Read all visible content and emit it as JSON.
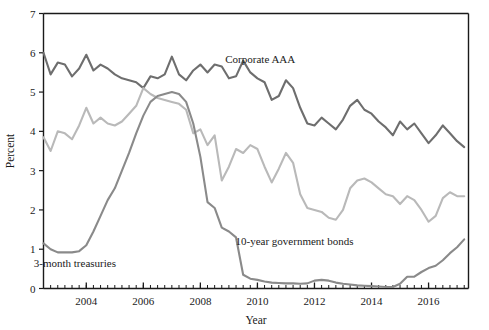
{
  "chart_data": {
    "type": "line",
    "title": "",
    "xlabel": "Year",
    "ylabel": "Percent",
    "xlim": [
      2002.5,
      2017.4
    ],
    "ylim": [
      0,
      7
    ],
    "yticks": [
      0,
      1,
      2,
      3,
      4,
      5,
      6,
      7
    ],
    "ytick_labels": [
      "0",
      "1",
      "2",
      "3",
      "4",
      "5",
      "6",
      "7"
    ],
    "xticks": [
      2004,
      2006,
      2008,
      2010,
      2012,
      2014,
      2016
    ],
    "xtick_labels": [
      "2004",
      "2006",
      "2008",
      "2010",
      "2012",
      "2014",
      "2016"
    ],
    "minor_xtick_interval": 0.25,
    "grid": false,
    "legend_position": "inline-annotations",
    "colors": {
      "corporate_aaa": "#6e6e6e",
      "ten_year_government_bonds": "#b9b9b9",
      "three_month_treasuries": "#8a8a8a",
      "axis": "#1a1a1a",
      "background": "#ffffff"
    },
    "annotations": [
      {
        "name": "corporate-aaa-label",
        "text": "Corporate AAA",
        "x": 2010.1,
        "y": 5.75
      },
      {
        "name": "ten-year-bonds-label",
        "text": "10-year government bonds",
        "x": 2011.3,
        "y": 1.1
      },
      {
        "name": "three-month-treasuries-label",
        "text": "3-month treasuries",
        "x": 2003.6,
        "y": 0.55
      }
    ],
    "x": [
      2002.5,
      2002.75,
      2003.0,
      2003.25,
      2003.5,
      2003.75,
      2004.0,
      2004.25,
      2004.5,
      2004.75,
      2005.0,
      2005.25,
      2005.5,
      2005.75,
      2006.0,
      2006.25,
      2006.5,
      2006.75,
      2007.0,
      2007.25,
      2007.5,
      2007.75,
      2008.0,
      2008.25,
      2008.5,
      2008.75,
      2009.0,
      2009.25,
      2009.5,
      2009.75,
      2010.0,
      2010.25,
      2010.5,
      2010.75,
      2011.0,
      2011.25,
      2011.5,
      2011.75,
      2012.0,
      2012.25,
      2012.5,
      2012.75,
      2013.0,
      2013.25,
      2013.5,
      2013.75,
      2014.0,
      2014.25,
      2014.5,
      2014.75,
      2015.0,
      2015.25,
      2015.5,
      2015.75,
      2016.0,
      2016.25,
      2016.5,
      2016.75,
      2017.0,
      2017.25
    ],
    "series": [
      {
        "name": "Corporate AAA",
        "key": "corporate_aaa",
        "color": "#6e6e6e",
        "values": [
          6.0,
          5.45,
          5.75,
          5.7,
          5.4,
          5.6,
          5.95,
          5.55,
          5.7,
          5.6,
          5.45,
          5.35,
          5.3,
          5.25,
          5.1,
          5.4,
          5.35,
          5.45,
          5.9,
          5.45,
          5.3,
          5.55,
          5.7,
          5.5,
          5.7,
          5.65,
          5.35,
          5.4,
          5.8,
          5.5,
          5.35,
          5.25,
          4.8,
          4.9,
          5.3,
          5.1,
          4.6,
          4.2,
          4.15,
          4.35,
          4.2,
          4.05,
          4.3,
          4.65,
          4.8,
          4.55,
          4.45,
          4.25,
          4.1,
          3.9,
          4.25,
          4.05,
          4.2,
          3.95,
          3.7,
          3.9,
          4.15,
          3.95,
          3.75,
          3.6
        ]
      },
      {
        "name": "10-year government bonds",
        "key": "ten_year_government_bonds",
        "color": "#b9b9b9",
        "values": [
          3.85,
          3.5,
          4.0,
          3.95,
          3.8,
          4.15,
          4.6,
          4.2,
          4.35,
          4.2,
          4.15,
          4.25,
          4.45,
          4.65,
          5.1,
          4.95,
          4.85,
          4.8,
          4.75,
          4.7,
          4.55,
          3.95,
          4.05,
          3.65,
          3.9,
          2.75,
          3.1,
          3.55,
          3.45,
          3.65,
          3.55,
          3.1,
          2.7,
          3.05,
          3.45,
          3.2,
          2.4,
          2.05,
          2.0,
          1.95,
          1.8,
          1.75,
          2.0,
          2.55,
          2.75,
          2.8,
          2.7,
          2.55,
          2.4,
          2.35,
          2.15,
          2.35,
          2.25,
          2.0,
          1.7,
          1.85,
          2.3,
          2.45,
          2.35,
          2.35
        ]
      },
      {
        "name": "3-month treasuries",
        "key": "three_month_treasuries",
        "color": "#8a8a8a",
        "values": [
          1.15,
          1.0,
          0.92,
          0.92,
          0.92,
          0.95,
          1.1,
          1.45,
          1.85,
          2.25,
          2.55,
          3.0,
          3.45,
          3.95,
          4.4,
          4.75,
          4.9,
          4.95,
          5.0,
          4.95,
          4.75,
          4.2,
          3.35,
          2.2,
          2.05,
          1.55,
          1.45,
          1.3,
          0.35,
          0.25,
          0.22,
          0.18,
          0.15,
          0.14,
          0.13,
          0.13,
          0.12,
          0.13,
          0.2,
          0.22,
          0.2,
          0.15,
          0.12,
          0.1,
          0.08,
          0.07,
          0.06,
          0.05,
          0.04,
          0.04,
          0.12,
          0.3,
          0.3,
          0.42,
          0.52,
          0.58,
          0.72,
          0.9,
          1.05,
          1.25
        ]
      }
    ]
  }
}
